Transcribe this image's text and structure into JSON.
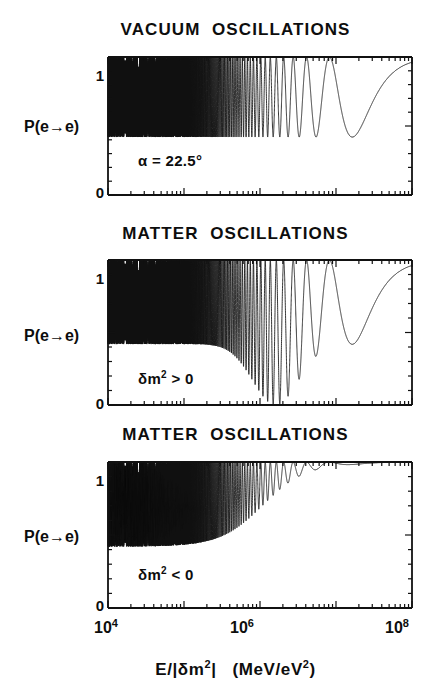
{
  "figure": {
    "xaxis_label": "E/|δm²|   (MeV/eV²)",
    "xtick_labels": [
      "10⁴",
      "10⁶",
      "10⁸"
    ],
    "ytick_top": "1",
    "ytick_bottom": "0",
    "ylabel": "P(e→e)",
    "ink_color": "#111111",
    "background_color": "#ffffff"
  },
  "panels": [
    {
      "title": "VACUUM  OSCILLATIONS",
      "annotation": "α = 22.5°",
      "ylabel": "P(e→e)"
    },
    {
      "title": "MATTER  OSCILLATIONS",
      "annotation_base": "δm",
      "annotation_exp": "2",
      "annotation_tail": " > 0",
      "annotation": "δm² > 0",
      "ylabel": "P(e→e)"
    },
    {
      "title": "MATTER  OSCILLATIONS",
      "annotation_base": "δm",
      "annotation_exp": "2",
      "annotation_tail": " < 0",
      "annotation": "δm² < 0",
      "ylabel": "P(e→e)"
    }
  ],
  "chart_data": {
    "type": "line",
    "xlabel": "E/|δm²|   (MeV/eV²)",
    "ylabel": "P(e→e)",
    "xscale": "log",
    "xlim": [
      10000,
      100000000
    ],
    "ylim": [
      0,
      1
    ],
    "ytick_values": [
      0,
      1
    ],
    "ytick_labels": [
      "0",
      "1"
    ],
    "xtick_values": [
      10000,
      1000000,
      100000000
    ],
    "xtick_labels": [
      "10⁴",
      "10⁶",
      "10⁸"
    ],
    "grid": false,
    "legend": "none",
    "minor_ticks": "logarithmic decade subdivisions on all four axes",
    "panels": [
      {
        "name": "VACUUM  OSCILLATIONS",
        "annotation": "α = 22.5°",
        "mixing_angle_deg": 22.5,
        "oscillation_amplitude": 0.58,
        "envelope_min": 0.42,
        "envelope_max": 1.0,
        "description": "Pure vacuum oscillation; constant amplitude sin²(2α)=0.5 envelope between P=0.42 and P=1. Oscillations unresolved (solid black) below E/|δm²| ≈ 2×10⁵, resolved above, final dip at ≈ 2×10⁶ then P→1 at high energy.",
        "unresolved_until": 200000,
        "last_minimum_x": 2000000,
        "last_minimum_y": 0.42,
        "high_energy_limit": 1.0
      },
      {
        "name": "MATTER  OSCILLATIONS (δm² > 0)",
        "annotation": "δm² > 0",
        "sign_delta_m2": "positive",
        "envelope_min": 0.42,
        "envelope_max": 1.0,
        "resonance_x": 1600000,
        "resonance_y": 0.0,
        "description": "MSW resonant enhancement: amplitude grows with energy, deep minimum reaching P≈0 at E/|δm²|≈1.6×10⁶, then P rises back toward 1 at high energy.",
        "unresolved_until": 200000,
        "high_energy_limit": 1.0
      },
      {
        "name": "MATTER  OSCILLATIONS (δm² < 0)",
        "annotation": "δm² < 0",
        "sign_delta_m2": "negative",
        "envelope_min": 0.42,
        "envelope_max": 1.0,
        "description": "Matter suppression: oscillation amplitude damps with increasing energy, shallow dip near 1.5×10⁶ reaching P≈0.78, then P≈1 flat at high energy.",
        "unresolved_until": 200000,
        "last_minimum_x": 1500000,
        "last_minimum_y": 0.78,
        "high_energy_limit": 1.0
      }
    ]
  }
}
